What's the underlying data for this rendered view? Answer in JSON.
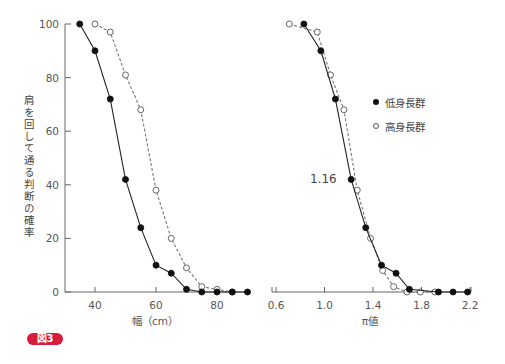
{
  "figure": {
    "badge": "図3",
    "ylabel": "肩を回して通る判断の確率"
  },
  "legend": {
    "items": [
      {
        "label": "低身長群",
        "marker": "filled"
      },
      {
        "label": "高身長群",
        "marker": "open"
      }
    ]
  },
  "annotation": "1.16",
  "colors": {
    "badge": "#d81a3c",
    "line": "#222222",
    "dashed": "#777777"
  },
  "chart_data": [
    {
      "type": "line",
      "title": "",
      "xlabel": "幅（cm）",
      "ylabel": "肩を回して通る判断の確率",
      "xlim": [
        30,
        90
      ],
      "ylim": [
        0,
        100
      ],
      "xticks": [
        40,
        60,
        80
      ],
      "yticks": [
        0,
        20,
        40,
        60,
        80,
        100
      ],
      "grid": false,
      "series": [
        {
          "name": "低身長群",
          "marker": "filled",
          "style": "solid",
          "x": [
            35,
            40,
            45,
            50,
            55,
            60,
            65,
            70,
            75,
            80,
            85,
            90
          ],
          "values": [
            100,
            90,
            72,
            42,
            24,
            10,
            7,
            1,
            0,
            0,
            0,
            0
          ]
        },
        {
          "name": "高身長群",
          "marker": "open",
          "style": "dashed",
          "x": [
            40,
            45,
            50,
            55,
            60,
            65,
            70,
            75,
            80,
            85
          ],
          "values": [
            100,
            97,
            81,
            68,
            38,
            20,
            9,
            2,
            1,
            0
          ]
        }
      ]
    },
    {
      "type": "line",
      "title": "",
      "xlabel": "π値",
      "ylabel": "",
      "xlim": [
        0.6,
        2.2
      ],
      "ylim": [
        0,
        100
      ],
      "xticks": [
        0.6,
        1.0,
        1.4,
        1.8,
        2.2
      ],
      "grid": false,
      "annotations": [
        {
          "text": "1.16",
          "x": 1.16,
          "y": 42
        }
      ],
      "legend_position": "upper right",
      "series": [
        {
          "name": "低身長群",
          "marker": "filled",
          "style": "solid",
          "x": [
            0.83,
            0.97,
            1.09,
            1.22,
            1.34,
            1.47,
            1.59,
            1.7,
            1.94,
            2.06,
            2.18
          ],
          "values": [
            100,
            90,
            72,
            42,
            24,
            10,
            7,
            1,
            0,
            0,
            0
          ]
        },
        {
          "name": "高身長群",
          "marker": "open",
          "style": "dashed",
          "x": [
            0.71,
            0.94,
            1.05,
            1.16,
            1.27,
            1.38,
            1.48,
            1.57,
            1.68,
            1.79,
            1.91
          ],
          "values": [
            100,
            97,
            81,
            68,
            38,
            20,
            8,
            2,
            0,
            0,
            0
          ]
        }
      ]
    }
  ]
}
